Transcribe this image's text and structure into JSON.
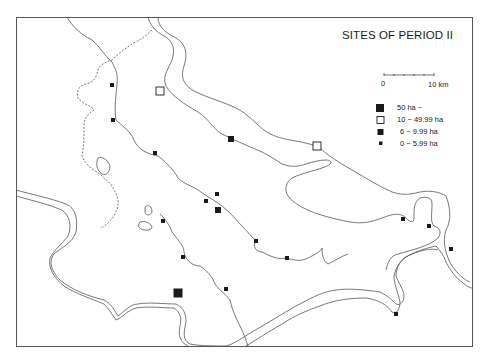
{
  "title": "SITES OF PERIOD II",
  "scale_bar": {
    "start_label": "0",
    "end_label": "10 km"
  },
  "legend": [
    {
      "symbol": "large-filled-square",
      "label": "50 ha ~"
    },
    {
      "symbol": "hollow-square",
      "label": "10 ~ 49.99 ha"
    },
    {
      "symbol": "medium-filled-square",
      "label": "6 ~ 9.99 ha"
    },
    {
      "symbol": "small-filled-square",
      "label": "0 ~ 5.99 ha"
    }
  ],
  "colors": {
    "ink": "#1a1a1a",
    "river": "#555555",
    "background": "#ffffff"
  },
  "sites": [
    {
      "x": 160,
      "y": 91,
      "class": "10-49.99"
    },
    {
      "x": 317,
      "y": 146,
      "class": "10-49.99"
    },
    {
      "x": 178,
      "y": 293,
      "class": "50+"
    },
    {
      "x": 231,
      "y": 139,
      "class": "6-9.99"
    },
    {
      "x": 218,
      "y": 210,
      "class": "6-9.99"
    },
    {
      "x": 112,
      "y": 85,
      "class": "0-5.99"
    },
    {
      "x": 113,
      "y": 120,
      "class": "0-5.99"
    },
    {
      "x": 155,
      "y": 153,
      "class": "0-5.99"
    },
    {
      "x": 217,
      "y": 194,
      "class": "0-5.99"
    },
    {
      "x": 206,
      "y": 201,
      "class": "0-5.99"
    },
    {
      "x": 163,
      "y": 221,
      "class": "0-5.99"
    },
    {
      "x": 183,
      "y": 257,
      "class": "0-5.99"
    },
    {
      "x": 256,
      "y": 241,
      "class": "0-5.99"
    },
    {
      "x": 287,
      "y": 258,
      "class": "0-5.99"
    },
    {
      "x": 226,
      "y": 289,
      "class": "0-5.99"
    },
    {
      "x": 403,
      "y": 219,
      "class": "0-5.99"
    },
    {
      "x": 429,
      "y": 226,
      "class": "0-5.99"
    },
    {
      "x": 451,
      "y": 249,
      "class": "0-5.99"
    },
    {
      "x": 396,
      "y": 314,
      "class": "0-5.99"
    }
  ]
}
